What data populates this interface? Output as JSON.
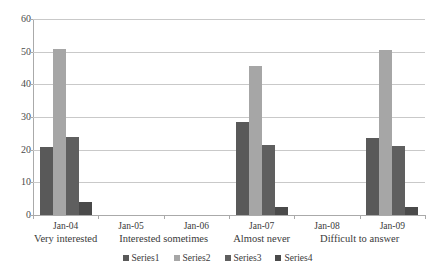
{
  "chart_data": {
    "type": "bar",
    "title": "",
    "subtitle": "",
    "xlabel": "",
    "ylabel": "",
    "ylim": [
      0,
      60
    ],
    "yticks": [
      0,
      10,
      20,
      30,
      40,
      50,
      60
    ],
    "grid": true,
    "legend_position": "bottom-center",
    "categories": [
      "Jan-04",
      "Jan-05",
      "Jan-06",
      "Jan-07",
      "Jan-08",
      "Jan-09"
    ],
    "group_labels": [
      {
        "text": "Very interested",
        "spans": [
          "Jan-04"
        ]
      },
      {
        "text": "Interested sometimes",
        "spans": [
          "Jan-05",
          "Jan-06"
        ]
      },
      {
        "text": "Almost never",
        "spans": [
          "Jan-07"
        ]
      },
      {
        "text": "Difficult to answer",
        "spans": [
          "Jan-08",
          "Jan-09"
        ]
      }
    ],
    "series": [
      {
        "name": "Series1",
        "color": "#595959",
        "values": [
          20.8,
          0,
          0,
          28.5,
          0,
          23.6
        ]
      },
      {
        "name": "Series2",
        "color": "#a6a6a6",
        "values": [
          50.8,
          0,
          0,
          45.5,
          0,
          50.5
        ]
      },
      {
        "name": "Series3",
        "color": "#5f5f5f",
        "values": [
          23.8,
          0,
          0,
          21.3,
          0,
          21.0
        ]
      },
      {
        "name": "Series4",
        "color": "#4a4a4a",
        "values": [
          4.0,
          0,
          0,
          2.5,
          0,
          2.5
        ]
      }
    ]
  }
}
